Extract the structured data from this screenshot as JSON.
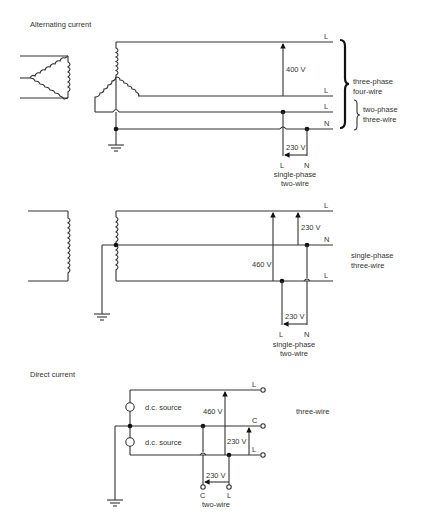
{
  "sections": {
    "ac": {
      "heading": "Alternating current",
      "three_phase": {
        "line_labels": [
          "L",
          "L",
          "L",
          "N"
        ],
        "voltage_ll": "400 V",
        "voltage_ln": "230 V",
        "group_four_wire": [
          "three-phase",
          "four-wire"
        ],
        "group_two_phase": [
          "two-phase",
          "three-wire"
        ],
        "tap_labels": [
          "L",
          "N"
        ],
        "tap_caption": [
          "single-phase",
          "two-wire"
        ]
      },
      "single_phase": {
        "line_labels": [
          "L",
          "N",
          "L"
        ],
        "voltage_outer": "460 V",
        "voltage_half": "230 V",
        "voltage_tap": "230 V",
        "group": [
          "single-phase",
          "three-wire"
        ],
        "tap_labels": [
          "L",
          "N"
        ],
        "tap_caption": [
          "single-phase",
          "two-wire"
        ]
      }
    },
    "dc": {
      "heading": "Direct current",
      "source_labels": [
        "d.c. source",
        "d.c. source"
      ],
      "line_labels": [
        "L",
        "C",
        "L"
      ],
      "voltage_outer": "460 V",
      "voltage_half": "230 V",
      "voltage_tap": "230 V",
      "group": "three-wire",
      "tap_labels": [
        "C",
        "L"
      ],
      "tap_caption": "two-wire"
    }
  },
  "colors": {
    "line": "#333333",
    "text": "#333333",
    "background": "#ffffff"
  }
}
